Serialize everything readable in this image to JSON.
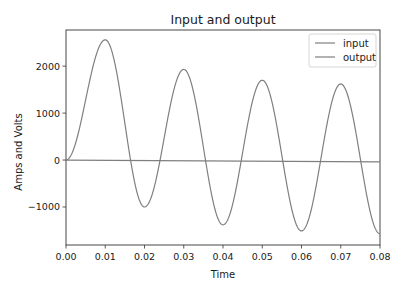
{
  "chart_data": {
    "type": "line",
    "title": "Input and output",
    "xlabel": "Time",
    "ylabel": "Amps and Volts",
    "xlim": [
      0.0,
      0.08
    ],
    "ylim": [
      -1810,
      2770
    ],
    "grid": false,
    "legend_position": "upper right",
    "x_ticks": [
      "0.00",
      "0.01",
      "0.02",
      "0.03",
      "0.04",
      "0.05",
      "0.06",
      "0.07",
      "0.08"
    ],
    "y_ticks": [
      "2000",
      "1000",
      "0",
      "−1000"
    ],
    "series": [
      {
        "name": "input",
        "color": "#808080",
        "description": "near-flat line close to zero, slight downward drift",
        "x": [
          0.0,
          0.08
        ],
        "y": [
          0,
          -40
        ]
      },
      {
        "name": "output",
        "color": "#808080",
        "description": "damped oscillation, period ~0.02",
        "x": [
          0.0,
          0.01,
          0.02,
          0.03,
          0.04,
          0.05,
          0.06,
          0.07,
          0.08
        ],
        "y": [
          0,
          2560,
          -1000,
          1930,
          -1380,
          1700,
          -1510,
          1620,
          -1570
        ]
      }
    ]
  },
  "labels": {
    "title": "Input and output",
    "xlabel": "Time",
    "ylabel": "Amps and Volts",
    "legend": [
      "input",
      "output"
    ]
  }
}
